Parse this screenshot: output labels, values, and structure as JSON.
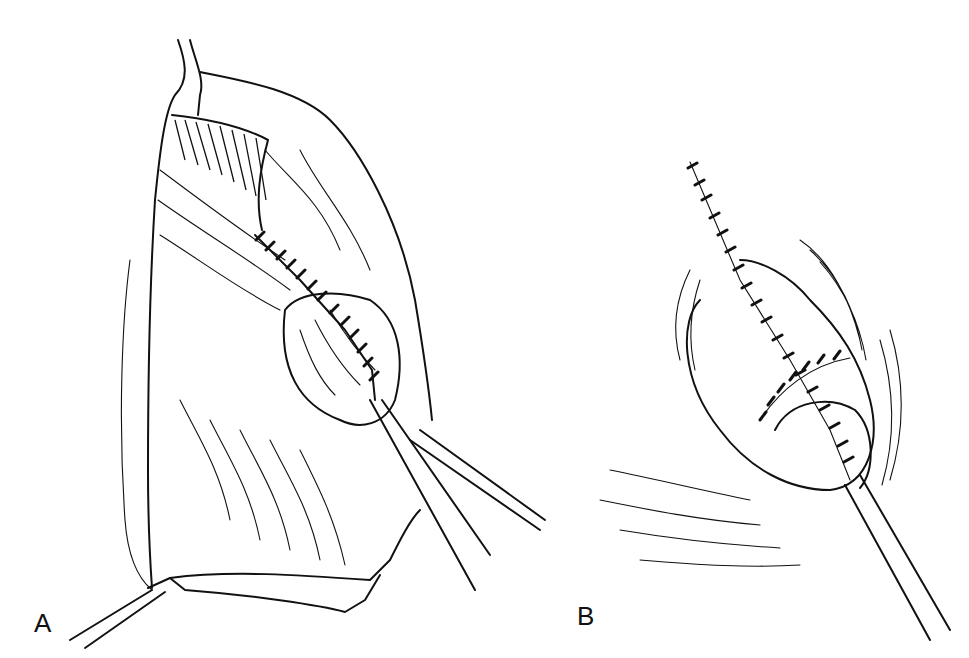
{
  "figure": {
    "panels": [
      {
        "id": "A",
        "label": "A",
        "description": "open surgical field with retractors and sutured repair"
      },
      {
        "id": "B",
        "label": "B",
        "description": "closed repair with continuous suture line and drain"
      }
    ],
    "colors": {
      "ink": "#111111",
      "background": "#ffffff"
    }
  }
}
